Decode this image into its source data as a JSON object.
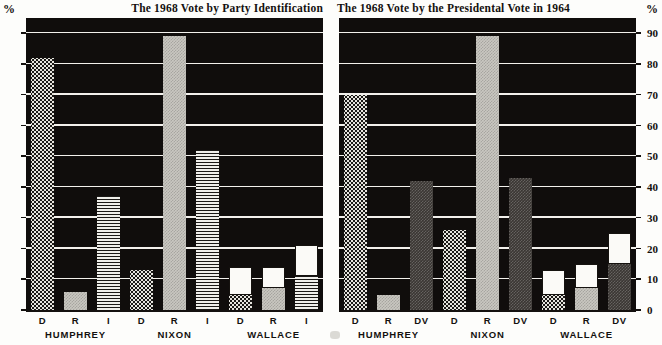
{
  "axis": {
    "unit_symbol": "%",
    "ticks": [
      0,
      10,
      20,
      30,
      40,
      50,
      60,
      70,
      80,
      90
    ],
    "ymin": 0,
    "ymax": 95
  },
  "panels": [
    {
      "id": "left",
      "title": "The 1968 Vote by Party Identification",
      "groups": [
        {
          "name": "HUMPHREY",
          "bars": [
            {
              "label": "D",
              "fill": "dots",
              "value": 82,
              "base": 82
            },
            {
              "label": "R",
              "fill": "gray",
              "value": 6,
              "base": 6
            },
            {
              "label": "I",
              "fill": "wave",
              "value": 37,
              "base": 37
            }
          ]
        },
        {
          "name": "NIXON",
          "bars": [
            {
              "label": "D",
              "fill": "dots",
              "value": 13,
              "base": 13
            },
            {
              "label": "R",
              "fill": "gray",
              "value": 89,
              "base": 89
            },
            {
              "label": "I",
              "fill": "wave",
              "value": 52,
              "base": 52
            }
          ]
        },
        {
          "name": "WALLACE",
          "bars": [
            {
              "label": "D",
              "fill": "dots",
              "value": 14,
              "base": 5
            },
            {
              "label": "R",
              "fill": "gray",
              "value": 14,
              "base": 7
            },
            {
              "label": "I",
              "fill": "wave",
              "value": 21,
              "base": 11
            }
          ]
        }
      ]
    },
    {
      "id": "right",
      "title": "The 1968 Vote by the Presidental Vote in 1964",
      "groups": [
        {
          "name": "HUMPHREY",
          "bars": [
            {
              "label": "D",
              "fill": "dots",
              "value": 70,
              "base": 70
            },
            {
              "label": "R",
              "fill": "gray",
              "value": 5,
              "base": 5
            },
            {
              "label": "DV",
              "fill": "dark",
              "value": 42,
              "base": 42
            }
          ]
        },
        {
          "name": "NIXON",
          "bars": [
            {
              "label": "D",
              "fill": "dots",
              "value": 26,
              "base": 26
            },
            {
              "label": "R",
              "fill": "gray",
              "value": 89,
              "base": 89
            },
            {
              "label": "DV",
              "fill": "dark",
              "value": 43,
              "base": 43
            }
          ]
        },
        {
          "name": "WALLACE",
          "bars": [
            {
              "label": "D",
              "fill": "dots",
              "value": 13,
              "base": 5
            },
            {
              "label": "R",
              "fill": "gray",
              "value": 15,
              "base": 7
            },
            {
              "label": "DV",
              "fill": "dark",
              "value": 25,
              "base": 15
            }
          ]
        }
      ]
    }
  ],
  "chart_data": {
    "type": "bar",
    "xlabel": "",
    "ylabel": "%",
    "ylim": [
      0,
      95
    ],
    "grid": true,
    "legend": "none",
    "charts": [
      {
        "type": "bar",
        "title": "The 1968 Vote by Party Identification",
        "xlabel": "",
        "ylabel": "%",
        "ylim": [
          0,
          95
        ],
        "categories": [
          "HUMPHREY",
          "NIXON",
          "WALLACE"
        ],
        "subcategories": [
          "D",
          "R",
          "I"
        ],
        "note": "WALLACE bars are stacked: textured lower segment plus white upper segment; value = total, base = textured segment height",
        "series": [
          {
            "name": "D",
            "values": [
              82,
              13,
              14
            ],
            "stacked_base": [
              82,
              13,
              5
            ]
          },
          {
            "name": "R",
            "values": [
              6,
              89,
              14
            ],
            "stacked_base": [
              6,
              89,
              7
            ]
          },
          {
            "name": "I",
            "values": [
              37,
              52,
              21
            ],
            "stacked_base": [
              37,
              52,
              11
            ]
          }
        ],
        "tick_labels": [
          0,
          10,
          20,
          30,
          40,
          50,
          60,
          70,
          80,
          90
        ]
      },
      {
        "type": "bar",
        "title": "The 1968 Vote by the Presidental Vote in 1964",
        "xlabel": "",
        "ylabel": "%",
        "ylim": [
          0,
          95
        ],
        "categories": [
          "HUMPHREY",
          "NIXON",
          "WALLACE"
        ],
        "subcategories": [
          "D",
          "R",
          "DV"
        ],
        "note": "WALLACE bars are stacked: textured lower segment plus white upper segment; value = total, base = textured segment height",
        "series": [
          {
            "name": "D",
            "values": [
              70,
              26,
              13
            ],
            "stacked_base": [
              70,
              26,
              5
            ]
          },
          {
            "name": "R",
            "values": [
              5,
              89,
              15
            ],
            "stacked_base": [
              5,
              89,
              7
            ]
          },
          {
            "name": "DV",
            "values": [
              42,
              43,
              25
            ],
            "stacked_base": [
              42,
              43,
              15
            ]
          }
        ],
        "tick_labels": [
          0,
          10,
          20,
          30,
          40,
          50,
          60,
          70,
          80,
          90
        ]
      }
    ]
  }
}
